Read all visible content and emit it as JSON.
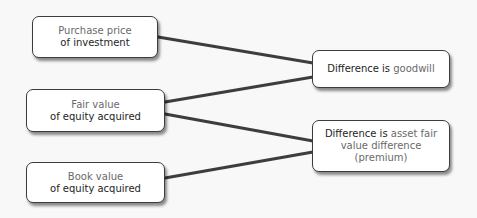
{
  "diagram": {
    "left_nodes": [
      {
        "id": "purchase",
        "line1": "Purchase price",
        "line2": "of investment"
      },
      {
        "id": "fair",
        "line1": "Fair value",
        "line2": "of equity acquired"
      },
      {
        "id": "book",
        "line1": "Book value",
        "line2": "of equity acquired"
      }
    ],
    "right_nodes": [
      {
        "id": "goodwill",
        "prefix": "Difference is ",
        "term": "goodwill"
      },
      {
        "id": "premium",
        "prefix": "Difference is ",
        "term_line1": "asset fair",
        "term_line2": "value difference",
        "term_line3": "(premium)"
      }
    ],
    "edges": [
      {
        "from": "purchase",
        "to": "goodwill"
      },
      {
        "from": "fair",
        "to": "goodwill"
      },
      {
        "from": "fair",
        "to": "premium"
      },
      {
        "from": "book",
        "to": "premium"
      }
    ],
    "colors": {
      "line": "#3d3d3d",
      "box_border": "#3c3c3c",
      "emphasis_text": "#1e1e1e",
      "muted_text": "#6a6a6a"
    }
  }
}
